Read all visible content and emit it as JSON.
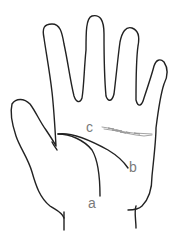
{
  "diagram": {
    "labels": {
      "a": "a",
      "b": "b",
      "c": "c"
    },
    "line_color": "#222222",
    "label_color": "#7a7a7a",
    "faint_line_color": "#9a9a9a"
  },
  "caption": {
    "fragments": [
      "",
      "",
      "",
      "",
      ""
    ]
  }
}
